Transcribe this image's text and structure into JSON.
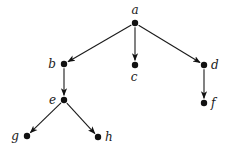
{
  "diagram": {
    "type": "directed-tree",
    "colors": {
      "ink": "#111111",
      "background": "#ffffff"
    },
    "nodes": [
      {
        "id": "a",
        "label": "a",
        "x": 135,
        "y": 23,
        "lx": 135,
        "ly": 14,
        "anchor": "middle"
      },
      {
        "id": "b",
        "label": "b",
        "x": 64,
        "y": 64,
        "lx": 56,
        "ly": 68,
        "anchor": "end"
      },
      {
        "id": "c",
        "label": "c",
        "x": 135,
        "y": 65,
        "lx": 134,
        "ly": 81,
        "anchor": "middle"
      },
      {
        "id": "d",
        "label": "d",
        "x": 204,
        "y": 65,
        "lx": 211,
        "ly": 69,
        "anchor": "start"
      },
      {
        "id": "e",
        "label": "e",
        "x": 64,
        "y": 100,
        "lx": 56,
        "ly": 104,
        "anchor": "end"
      },
      {
        "id": "f",
        "label": "f",
        "x": 204,
        "y": 103,
        "lx": 211,
        "ly": 107,
        "anchor": "start"
      },
      {
        "id": "g",
        "label": "g",
        "x": 27,
        "y": 136,
        "lx": 19,
        "ly": 140,
        "anchor": "end"
      },
      {
        "id": "h",
        "label": "h",
        "x": 98,
        "y": 137,
        "lx": 105,
        "ly": 141,
        "anchor": "start"
      }
    ],
    "edges": [
      {
        "from": "a",
        "to": "b"
      },
      {
        "from": "a",
        "to": "c"
      },
      {
        "from": "a",
        "to": "d"
      },
      {
        "from": "b",
        "to": "e"
      },
      {
        "from": "d",
        "to": "f"
      },
      {
        "from": "e",
        "to": "g"
      },
      {
        "from": "e",
        "to": "h"
      }
    ]
  }
}
